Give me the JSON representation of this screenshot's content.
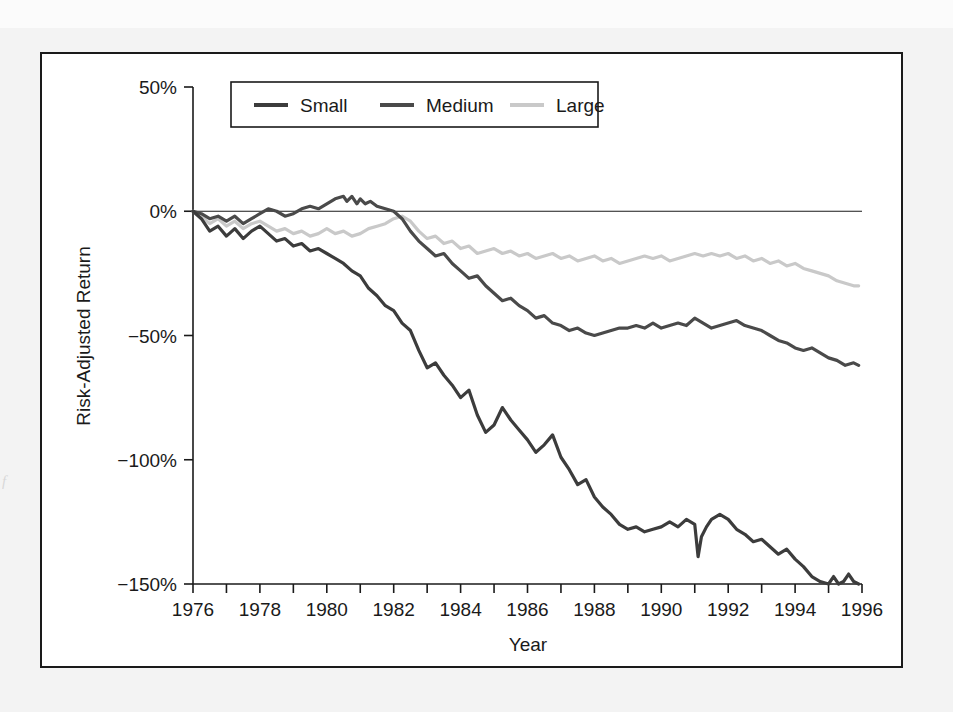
{
  "figure": {
    "background_color": "#ffffff",
    "frame_color": "#1a1a1a",
    "page_color": "#f3f3f3",
    "margin_note": "f"
  },
  "chart_data": {
    "type": "line",
    "title": "",
    "xlabel": "Year",
    "ylabel": "Risk-Adjusted Return",
    "xlim": [
      1976,
      1996
    ],
    "ylim": [
      -150,
      50
    ],
    "ytick_values": [
      50,
      0,
      -50,
      -100,
      -150
    ],
    "ytick_labels": [
      "50%",
      "0%",
      "−50%",
      "−100%",
      "−150%"
    ],
    "xtick_values": [
      1976,
      1977,
      1978,
      1979,
      1980,
      1981,
      1982,
      1983,
      1984,
      1985,
      1986,
      1987,
      1988,
      1989,
      1990,
      1991,
      1992,
      1993,
      1994,
      1995,
      1996
    ],
    "xtick_labels": [
      "1976",
      "",
      "1978",
      "",
      "1980",
      "",
      "1982",
      "",
      "1984",
      "",
      "1986",
      "",
      "1988",
      "",
      "1990",
      "",
      "1992",
      "",
      "1994",
      "",
      "1996"
    ],
    "grid": false,
    "zero_line": true,
    "legend_position": "top-center",
    "legend_entries": [
      "Small",
      "Medium",
      "Large"
    ],
    "series": [
      {
        "name": "Small",
        "color": "#3c3c3c",
        "x": [
          1976.0,
          1976.25,
          1976.5,
          1976.75,
          1977.0,
          1977.25,
          1977.5,
          1977.75,
          1978.0,
          1978.25,
          1978.5,
          1978.75,
          1979.0,
          1979.25,
          1979.5,
          1979.75,
          1980.0,
          1980.25,
          1980.5,
          1980.75,
          1981.0,
          1981.25,
          1981.5,
          1981.75,
          1982.0,
          1982.25,
          1982.5,
          1982.75,
          1983.0,
          1983.25,
          1983.5,
          1983.75,
          1984.0,
          1984.25,
          1984.5,
          1984.75,
          1985.0,
          1985.25,
          1985.5,
          1985.75,
          1986.0,
          1986.25,
          1986.5,
          1986.75,
          1987.0,
          1987.25,
          1987.5,
          1987.75,
          1988.0,
          1988.25,
          1988.5,
          1988.75,
          1989.0,
          1989.25,
          1989.5,
          1989.75,
          1990.0,
          1990.25,
          1990.5,
          1990.75,
          1991.0,
          1991.1,
          1991.2,
          1991.35,
          1991.5,
          1991.75,
          1992.0,
          1992.25,
          1992.5,
          1992.75,
          1993.0,
          1993.25,
          1993.5,
          1993.75,
          1994.0,
          1994.25,
          1994.5,
          1994.75,
          1995.0,
          1995.15,
          1995.3,
          1995.45,
          1995.6,
          1995.75,
          1995.9
        ],
        "y": [
          0,
          -3,
          -8,
          -6,
          -10,
          -7,
          -11,
          -8,
          -6,
          -9,
          -12,
          -11,
          -14,
          -13,
          -16,
          -15,
          -17,
          -19,
          -21,
          -24,
          -26,
          -31,
          -34,
          -38,
          -40,
          -45,
          -48,
          -56,
          -63,
          -61,
          -66,
          -70,
          -75,
          -72,
          -82,
          -89,
          -86,
          -79,
          -84,
          -88,
          -92,
          -97,
          -94,
          -90,
          -99,
          -104,
          -110,
          -108,
          -115,
          -119,
          -122,
          -126,
          -128,
          -127,
          -129,
          -128,
          -127,
          -125,
          -127,
          -124,
          -126,
          -139,
          -131,
          -127,
          -124,
          -122,
          -124,
          -128,
          -130,
          -133,
          -132,
          -135,
          -138,
          -136,
          -140,
          -143,
          -147,
          -149,
          -150,
          -147,
          -150,
          -149,
          -146,
          -149,
          -150
        ]
      },
      {
        "name": "Medium",
        "color": "#4a4a4a",
        "x": [
          1976.0,
          1976.25,
          1976.5,
          1976.75,
          1977.0,
          1977.25,
          1977.5,
          1977.75,
          1978.0,
          1978.25,
          1978.5,
          1978.75,
          1979.0,
          1979.25,
          1979.5,
          1979.75,
          1980.0,
          1980.25,
          1980.5,
          1980.6,
          1980.75,
          1980.9,
          1981.0,
          1981.15,
          1981.3,
          1981.5,
          1981.75,
          1982.0,
          1982.25,
          1982.5,
          1982.75,
          1983.0,
          1983.25,
          1983.5,
          1983.75,
          1984.0,
          1984.25,
          1984.5,
          1984.75,
          1985.0,
          1985.25,
          1985.5,
          1985.75,
          1986.0,
          1986.25,
          1986.5,
          1986.75,
          1987.0,
          1987.25,
          1987.5,
          1987.75,
          1988.0,
          1988.25,
          1988.5,
          1988.75,
          1989.0,
          1989.25,
          1989.5,
          1989.75,
          1990.0,
          1990.25,
          1990.5,
          1990.75,
          1991.0,
          1991.25,
          1991.5,
          1991.75,
          1992.0,
          1992.25,
          1992.5,
          1992.75,
          1993.0,
          1993.25,
          1993.5,
          1993.75,
          1994.0,
          1994.25,
          1994.5,
          1994.75,
          1995.0,
          1995.25,
          1995.5,
          1995.75,
          1995.9
        ],
        "y": [
          0,
          -1,
          -3,
          -2,
          -4,
          -2,
          -5,
          -3,
          -1,
          1,
          0,
          -2,
          -1,
          1,
          2,
          1,
          3,
          5,
          6,
          4,
          6,
          3,
          5,
          3,
          4,
          2,
          1,
          0,
          -3,
          -8,
          -12,
          -15,
          -18,
          -17,
          -21,
          -24,
          -27,
          -26,
          -30,
          -33,
          -36,
          -35,
          -38,
          -40,
          -43,
          -42,
          -45,
          -46,
          -48,
          -47,
          -49,
          -50,
          -49,
          -48,
          -47,
          -47,
          -46,
          -47,
          -45,
          -47,
          -46,
          -45,
          -46,
          -43,
          -45,
          -47,
          -46,
          -45,
          -44,
          -46,
          -47,
          -48,
          -50,
          -52,
          -53,
          -55,
          -56,
          -55,
          -57,
          -59,
          -60,
          -62,
          -61,
          -62
        ]
      },
      {
        "name": "Large",
        "color": "#c9c9c9",
        "x": [
          1976.0,
          1976.25,
          1976.5,
          1976.75,
          1977.0,
          1977.25,
          1977.5,
          1977.75,
          1978.0,
          1978.25,
          1978.5,
          1978.75,
          1979.0,
          1979.25,
          1979.5,
          1979.75,
          1980.0,
          1980.25,
          1980.5,
          1980.75,
          1981.0,
          1981.25,
          1981.5,
          1981.75,
          1982.0,
          1982.25,
          1982.5,
          1982.75,
          1983.0,
          1983.25,
          1983.5,
          1983.75,
          1984.0,
          1984.25,
          1984.5,
          1984.75,
          1985.0,
          1985.25,
          1985.5,
          1985.75,
          1986.0,
          1986.25,
          1986.5,
          1986.75,
          1987.0,
          1987.25,
          1987.5,
          1987.75,
          1988.0,
          1988.25,
          1988.5,
          1988.75,
          1989.0,
          1989.25,
          1989.5,
          1989.75,
          1990.0,
          1990.25,
          1990.5,
          1990.75,
          1991.0,
          1991.25,
          1991.5,
          1991.75,
          1992.0,
          1992.25,
          1992.5,
          1992.75,
          1993.0,
          1993.25,
          1993.5,
          1993.75,
          1994.0,
          1994.25,
          1994.5,
          1994.75,
          1995.0,
          1995.25,
          1995.5,
          1995.75,
          1995.9
        ],
        "y": [
          0,
          -2,
          -5,
          -3,
          -6,
          -4,
          -7,
          -5,
          -4,
          -6,
          -8,
          -7,
          -9,
          -8,
          -10,
          -9,
          -7,
          -9,
          -8,
          -10,
          -9,
          -7,
          -6,
          -5,
          -3,
          -2,
          -4,
          -8,
          -11,
          -10,
          -13,
          -12,
          -15,
          -14,
          -17,
          -16,
          -15,
          -17,
          -16,
          -18,
          -17,
          -19,
          -18,
          -17,
          -19,
          -18,
          -20,
          -19,
          -18,
          -20,
          -19,
          -21,
          -20,
          -19,
          -18,
          -19,
          -18,
          -20,
          -19,
          -18,
          -17,
          -18,
          -17,
          -18,
          -17,
          -19,
          -18,
          -20,
          -19,
          -21,
          -20,
          -22,
          -21,
          -23,
          -24,
          -25,
          -26,
          -28,
          -29,
          -30,
          -30
        ]
      }
    ]
  }
}
